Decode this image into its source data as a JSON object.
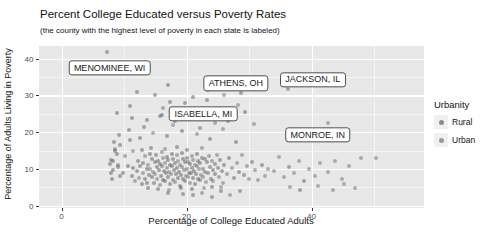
{
  "chart_data": {
    "type": "scatter",
    "title": "Percent College Educated versus Poverty Rates",
    "subtitle": "(the county with the highest level of poverty in each state is labeled)",
    "xlabel": "Percentage of College Educated Adults",
    "ylabel": "Percentage of Adults Living in Poverty",
    "xlim": [
      -3.68,
      58
    ],
    "ylim": [
      -0.6,
      43.4
    ],
    "x_ticks": [
      0,
      20,
      40
    ],
    "y_ticks": [
      0,
      10,
      20,
      30,
      40
    ],
    "x_minor_ticks": [
      10,
      30,
      50
    ],
    "y_minor_ticks": [
      5,
      15,
      25,
      35
    ],
    "grid": "on",
    "colors": {
      "panel_bg": "#e8e8e8",
      "grid": "#ffffff",
      "rural_point": "#575757",
      "urban_point": "#6b6b6b",
      "point_opacity": 0.5,
      "tick_text": "#4d4d4d",
      "text": "#141414"
    },
    "legend": {
      "title": "Urbanity",
      "position": "right",
      "entries": [
        {
          "label": "Rural",
          "group": "r",
          "color": "#6a6a6a"
        },
        {
          "label": "Urban",
          "group": "u",
          "color": "#7d7d7d"
        }
      ]
    },
    "labeled_points": [
      {
        "label": "MENOMINEE, WI",
        "x": 7.3,
        "y": 41.8,
        "label_x": 7.7,
        "label_y": 37.4,
        "group": "r"
      },
      {
        "label": "ATHENS, OH",
        "x": 28.7,
        "y": 30.6,
        "label_x": 27.9,
        "label_y": 33.3,
        "group": "r"
      },
      {
        "label": "JACKSON, IL",
        "x": 36.3,
        "y": 31.6,
        "label_x": 40.2,
        "label_y": 34.2,
        "group": "r"
      },
      {
        "label": "ISABELLA, MI",
        "x": 16.0,
        "y": 24.6,
        "label_x": 22.7,
        "label_y": 24.9,
        "group": "r"
      },
      {
        "label": "MONROE, IN",
        "x": 42.7,
        "y": 22.5,
        "label_x": 41.0,
        "label_y": 19.2,
        "group": "u"
      }
    ],
    "points": [
      [
        11.2,
        8.1,
        "r"
      ],
      [
        11.5,
        10.3,
        "r"
      ],
      [
        11.8,
        6.7,
        "u"
      ],
      [
        12.1,
        9.4,
        "r"
      ],
      [
        12.3,
        12.2,
        "r"
      ],
      [
        12.4,
        7.5,
        "u"
      ],
      [
        12.6,
        10.8,
        "r"
      ],
      [
        12.8,
        5.9,
        "r"
      ],
      [
        13,
        8.8,
        "u"
      ],
      [
        13.1,
        11.5,
        "r"
      ],
      [
        13.3,
        7.2,
        "r"
      ],
      [
        13.4,
        13.6,
        "u"
      ],
      [
        13.6,
        9.9,
        "r"
      ],
      [
        13.7,
        6.3,
        "r"
      ],
      [
        13.9,
        11.1,
        "u"
      ],
      [
        14,
        8.4,
        "r"
      ],
      [
        14.1,
        14.2,
        "r"
      ],
      [
        14.2,
        10.1,
        "u"
      ],
      [
        14.4,
        7.8,
        "r"
      ],
      [
        14.5,
        12.7,
        "r"
      ],
      [
        14.6,
        9.2,
        "u"
      ],
      [
        14.8,
        6.1,
        "r"
      ],
      [
        14.9,
        11.8,
        "r"
      ],
      [
        15,
        8.6,
        "u"
      ],
      [
        15.1,
        13.9,
        "r"
      ],
      [
        15.2,
        10.5,
        "r"
      ],
      [
        15.3,
        7.4,
        "u"
      ],
      [
        15.5,
        12.1,
        "r"
      ],
      [
        15.6,
        9.7,
        "r"
      ],
      [
        15.7,
        5.6,
        "u"
      ],
      [
        15.8,
        11.3,
        "r"
      ],
      [
        15.9,
        8.2,
        "r"
      ],
      [
        16,
        14.6,
        "u"
      ],
      [
        16.1,
        10.9,
        "r"
      ],
      [
        16.2,
        7.1,
        "r"
      ],
      [
        16.3,
        12.9,
        "u"
      ],
      [
        16.4,
        9.5,
        "r"
      ],
      [
        16.5,
        6.6,
        "r"
      ],
      [
        16.6,
        11.7,
        "u"
      ],
      [
        16.7,
        8.9,
        "r"
      ],
      [
        16.8,
        13.3,
        "r"
      ],
      [
        16.9,
        10.2,
        "u"
      ],
      [
        17,
        7.7,
        "r"
      ],
      [
        17.1,
        12.4,
        "r"
      ],
      [
        17.2,
        9.1,
        "u"
      ],
      [
        17.3,
        5.8,
        "r"
      ],
      [
        17.4,
        11,
        "r"
      ],
      [
        17.5,
        8.5,
        "u"
      ],
      [
        17.6,
        14.1,
        "r"
      ],
      [
        17.7,
        10.7,
        "r"
      ],
      [
        17.8,
        7,
        "u"
      ],
      [
        17.9,
        12.8,
        "r"
      ],
      [
        18,
        9.8,
        "r"
      ],
      [
        18.1,
        6.4,
        "u"
      ],
      [
        18.2,
        11.6,
        "r"
      ],
      [
        18.3,
        8.7,
        "r"
      ],
      [
        18.4,
        13.8,
        "u"
      ],
      [
        18.5,
        10.4,
        "r"
      ],
      [
        18.6,
        7.6,
        "r"
      ],
      [
        18.7,
        12.3,
        "u"
      ],
      [
        18.8,
        9.3,
        "r"
      ],
      [
        18.9,
        5.4,
        "r"
      ],
      [
        19,
        11.2,
        "u"
      ],
      [
        19.1,
        8.3,
        "r"
      ],
      [
        19.2,
        14.4,
        "r"
      ],
      [
        19.3,
        10.6,
        "u"
      ],
      [
        19.4,
        7.3,
        "r"
      ],
      [
        19.5,
        12.6,
        "r"
      ],
      [
        19.6,
        9.6,
        "u"
      ],
      [
        19.7,
        6.8,
        "r"
      ],
      [
        19.8,
        11.9,
        "r"
      ],
      [
        19.9,
        8,
        "u"
      ],
      [
        20,
        13.1,
        "r"
      ],
      [
        20.1,
        10,
        "r"
      ],
      [
        20.2,
        7.9,
        "u"
      ],
      [
        20.3,
        12,
        "r"
      ],
      [
        20.4,
        9,
        "r"
      ],
      [
        20.5,
        6.2,
        "u"
      ],
      [
        20.6,
        11.4,
        "r"
      ],
      [
        20.7,
        8.8,
        "r"
      ],
      [
        20.8,
        13.5,
        "u"
      ],
      [
        20.9,
        10.3,
        "r"
      ],
      [
        21,
        7.5,
        "r"
      ],
      [
        21.1,
        12.5,
        "u"
      ],
      [
        21.2,
        9.4,
        "r"
      ],
      [
        21.3,
        6,
        "r"
      ],
      [
        21.4,
        11.1,
        "u"
      ],
      [
        21.5,
        8.6,
        "r"
      ],
      [
        21.6,
        14,
        "r"
      ],
      [
        21.7,
        10.8,
        "u"
      ],
      [
        21.8,
        7.2,
        "r"
      ],
      [
        21.9,
        12.2,
        "r"
      ],
      [
        22,
        9.9,
        "u"
      ],
      [
        22.1,
        6.9,
        "r"
      ],
      [
        22.2,
        11.5,
        "r"
      ],
      [
        22.3,
        8.4,
        "u"
      ],
      [
        22.5,
        13,
        "r"
      ],
      [
        22.6,
        10.1,
        "r"
      ],
      [
        22.7,
        7.7,
        "u"
      ],
      [
        22.9,
        12.7,
        "r"
      ],
      [
        23,
        9.2,
        "r"
      ],
      [
        23.1,
        6.5,
        "u"
      ],
      [
        23.3,
        11.8,
        "r"
      ],
      [
        23.4,
        8.9,
        "r"
      ],
      [
        23.6,
        13.4,
        "u"
      ],
      [
        23.7,
        10.5,
        "r"
      ],
      [
        23.9,
        7.4,
        "r"
      ],
      [
        24,
        12.1,
        "u"
      ],
      [
        24.2,
        9.7,
        "r"
      ],
      [
        24.3,
        6.7,
        "u"
      ],
      [
        24.5,
        11.3,
        "r"
      ],
      [
        24.6,
        8.5,
        "r"
      ],
      [
        24.8,
        13.7,
        "u"
      ],
      [
        25,
        10.2,
        "r"
      ],
      [
        25.2,
        7.8,
        "u"
      ],
      [
        25.4,
        12.4,
        "r"
      ],
      [
        25.6,
        9.5,
        "r"
      ],
      [
        25.8,
        6.3,
        "u"
      ],
      [
        26,
        11,
        "r"
      ],
      [
        12.9,
        15.2,
        "r"
      ],
      [
        14.3,
        15.8,
        "r"
      ],
      [
        16.55,
        15.4,
        "u"
      ],
      [
        18.45,
        15.9,
        "r"
      ],
      [
        20.15,
        15.1,
        "r"
      ],
      [
        22.4,
        15.6,
        "u"
      ],
      [
        13.8,
        4.9,
        "r"
      ],
      [
        15.45,
        4.6,
        "r"
      ],
      [
        17.25,
        4.3,
        "u"
      ],
      [
        19.05,
        4.8,
        "r"
      ],
      [
        20.85,
        4.5,
        "r"
      ],
      [
        22.8,
        4.9,
        "u"
      ],
      [
        24.1,
        5.2,
        "r"
      ],
      [
        25.5,
        5,
        "u"
      ],
      [
        7.9,
        12.5,
        "r"
      ],
      [
        8.2,
        9.6,
        "r"
      ],
      [
        8.6,
        14.8,
        "r"
      ],
      [
        9,
        11.2,
        "u"
      ],
      [
        9.4,
        16.5,
        "r"
      ],
      [
        9.8,
        8.9,
        "r"
      ],
      [
        10.2,
        13.4,
        "u"
      ],
      [
        10.6,
        10.7,
        "r"
      ],
      [
        11,
        17.8,
        "r"
      ],
      [
        11.4,
        15,
        "u"
      ],
      [
        26.5,
        8.7,
        "u"
      ],
      [
        26.8,
        12.9,
        "r"
      ],
      [
        27.2,
        10.4,
        "u"
      ],
      [
        27.6,
        7.6,
        "r"
      ],
      [
        28,
        11.6,
        "u"
      ],
      [
        28.4,
        9.1,
        "r"
      ],
      [
        28.8,
        13.8,
        "u"
      ],
      [
        29.2,
        8.3,
        "r"
      ],
      [
        29.6,
        10.9,
        "u"
      ],
      [
        30,
        7.2,
        "u"
      ],
      [
        30.5,
        12,
        "r"
      ],
      [
        31,
        9.8,
        "u"
      ],
      [
        31.5,
        6.9,
        "u"
      ],
      [
        32,
        11.2,
        "r"
      ],
      [
        32.5,
        8.1,
        "u"
      ],
      [
        33,
        10,
        "u"
      ],
      [
        9.2,
        19.3,
        "r"
      ],
      [
        10.8,
        20.6,
        "r"
      ],
      [
        12.5,
        18.4,
        "r"
      ],
      [
        14.7,
        19.8,
        "u"
      ],
      [
        16.9,
        18.9,
        "r"
      ],
      [
        19.2,
        20.2,
        "r"
      ],
      [
        21.6,
        19.5,
        "u"
      ],
      [
        23.8,
        18.2,
        "r"
      ],
      [
        25.9,
        20.8,
        "u"
      ],
      [
        27.9,
        17.4,
        "r"
      ],
      [
        8.4,
        17.2,
        "r"
      ],
      [
        13.2,
        21.4,
        "r"
      ],
      [
        17.8,
        21.9,
        "u"
      ],
      [
        22.1,
        21.1,
        "r"
      ],
      [
        8.8,
        25.2,
        "r"
      ],
      [
        11,
        27.1,
        "r"
      ],
      [
        11.3,
        23.8,
        "r"
      ],
      [
        13.7,
        23.3,
        "r"
      ],
      [
        15.8,
        24.3,
        "r"
      ],
      [
        16.2,
        26.6,
        "u"
      ],
      [
        17.4,
        28.3,
        "r"
      ],
      [
        18.1,
        22.9,
        "r"
      ],
      [
        19,
        25.7,
        "u"
      ],
      [
        19.8,
        27.8,
        "r"
      ],
      [
        20.6,
        23.5,
        "r"
      ],
      [
        21.4,
        26.2,
        "u"
      ],
      [
        22.4,
        24.7,
        "r"
      ],
      [
        23.2,
        28.8,
        "r"
      ],
      [
        24.5,
        22.6,
        "u"
      ],
      [
        25.3,
        25.9,
        "r"
      ],
      [
        26.6,
        23.1,
        "r"
      ],
      [
        28.2,
        27.4,
        "u"
      ],
      [
        29.3,
        25.5,
        "r"
      ],
      [
        30.8,
        22.3,
        "u"
      ],
      [
        14.9,
        30.2,
        "r"
      ],
      [
        21,
        29.6,
        "r"
      ],
      [
        17,
        32.8,
        "r"
      ],
      [
        23.5,
        31.5,
        "r"
      ],
      [
        26,
        30.1,
        "u"
      ],
      [
        12,
        31,
        "r"
      ],
      [
        34,
        9.5,
        "u"
      ],
      [
        34.8,
        13.2,
        "u"
      ],
      [
        35.6,
        7.8,
        "u"
      ],
      [
        36.4,
        10.6,
        "r"
      ],
      [
        37.2,
        8.9,
        "u"
      ],
      [
        38,
        12.3,
        "u"
      ],
      [
        38.8,
        6.7,
        "r"
      ],
      [
        39.6,
        10.1,
        "u"
      ],
      [
        40.5,
        8,
        "u"
      ],
      [
        41.4,
        11.5,
        "u"
      ],
      [
        42.6,
        9.2,
        "u"
      ],
      [
        43.7,
        12.2,
        "u"
      ],
      [
        44.8,
        7.4,
        "u"
      ],
      [
        46,
        10.8,
        "u"
      ],
      [
        47.9,
        13,
        "u"
      ],
      [
        50.3,
        12.9,
        "u"
      ],
      [
        7.9,
        9,
        "r"
      ],
      [
        8.3,
        12.1,
        "r"
      ],
      [
        8,
        7.3,
        "r"
      ],
      [
        8.6,
        15.4,
        "r"
      ],
      [
        9.1,
        10.5,
        "r"
      ],
      [
        8.9,
        14,
        "r"
      ],
      [
        7.8,
        11.3,
        "r"
      ],
      [
        9.4,
        8.2,
        "r"
      ],
      [
        19.5,
        3.2,
        "r"
      ],
      [
        21,
        2.8,
        "r"
      ],
      [
        22.5,
        3.6,
        "u"
      ],
      [
        24,
        2.5,
        "r"
      ],
      [
        25.5,
        3.9,
        "r"
      ],
      [
        27,
        3,
        "u"
      ],
      [
        17,
        3.4,
        "r"
      ],
      [
        28.5,
        4.1,
        "r"
      ],
      [
        43.5,
        4.2,
        "u"
      ],
      [
        45.2,
        5.8,
        "u"
      ],
      [
        47,
        4.8,
        "u"
      ],
      [
        41,
        5.5,
        "u"
      ],
      [
        36.5,
        5,
        "u"
      ],
      [
        38.2,
        4.4,
        "r"
      ]
    ]
  }
}
